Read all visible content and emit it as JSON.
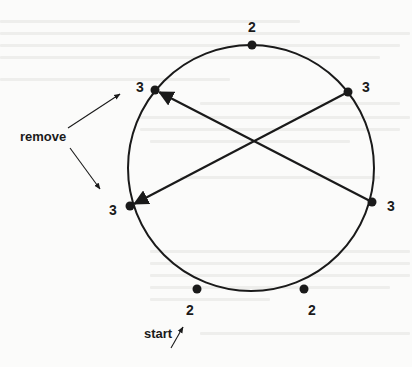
{
  "diagram": {
    "type": "circular graph with chords",
    "colors": {
      "stroke": "#1a1a1a",
      "background": "#fbfbfa"
    },
    "circle": {
      "cx": 251,
      "cy": 168,
      "r": 123
    },
    "nodes": [
      {
        "id": "top",
        "label": "2",
        "x": 252,
        "y": 45,
        "lx": 252,
        "ly": 28
      },
      {
        "id": "top-left",
        "label": "3",
        "x": 155,
        "y": 90,
        "lx": 140,
        "ly": 88
      },
      {
        "id": "top-right",
        "label": "3",
        "x": 348,
        "y": 92,
        "lx": 366,
        "ly": 88
      },
      {
        "id": "left",
        "label": "3",
        "x": 130,
        "y": 206,
        "lx": 113,
        "ly": 211
      },
      {
        "id": "right",
        "label": "3",
        "x": 372,
        "y": 202,
        "lx": 391,
        "ly": 207
      },
      {
        "id": "bottom-left",
        "label": "2",
        "x": 197,
        "y": 289,
        "lx": 190,
        "ly": 311
      },
      {
        "id": "bottom-right",
        "label": "2",
        "x": 304,
        "y": 289,
        "lx": 312,
        "ly": 311
      }
    ],
    "chords": [
      {
        "from": "right",
        "to": "top-left",
        "arrow": true
      },
      {
        "from": "top-right",
        "to": "left",
        "arrow": true
      }
    ],
    "annotations": [
      {
        "id": "remove",
        "label": "remove",
        "x": 20,
        "y": 141,
        "arrows": [
          {
            "x1": 68,
            "y1": 128,
            "x2": 120,
            "y2": 94
          },
          {
            "x1": 70,
            "y1": 148,
            "x2": 100,
            "y2": 189
          }
        ]
      },
      {
        "id": "start",
        "label": "start",
        "x": 144,
        "y": 338,
        "arrows": [
          {
            "x1": 171,
            "y1": 348,
            "x2": 183,
            "y2": 327
          }
        ]
      }
    ]
  }
}
